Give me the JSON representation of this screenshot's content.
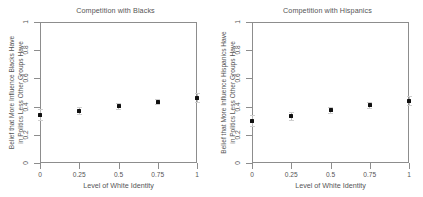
{
  "figure": {
    "xlabel": "Level of White Identity",
    "x_ticks": [
      "0",
      "0.25",
      "0.5",
      "0.75",
      "1"
    ],
    "y_ticks": [
      "0",
      "0.2",
      "0.4",
      "0.6",
      "0.8",
      "1"
    ]
  },
  "panels": [
    {
      "title": "Competition with Blacks",
      "ylabel_line1": "Belief that More Influence Blacks Have",
      "ylabel_line2": "in Politics Less Other Groups Have"
    },
    {
      "title": "Competition with Hispanics",
      "ylabel_line1": "Belief that More Influence Hispanics Have",
      "ylabel_line2": "in Politics Less Other Groups Have"
    }
  ],
  "chart_data": [
    {
      "type": "scatter",
      "title": "Competition with Blacks",
      "xlabel": "Level of White Identity",
      "ylabel": "Belief that More Influence Blacks Have in Politics Less Other Groups Have",
      "x": [
        0,
        0.25,
        0.5,
        0.75,
        1
      ],
      "values": [
        0.34,
        0.37,
        0.405,
        0.435,
        0.46
      ],
      "err_low": [
        0.305,
        0.345,
        0.385,
        0.415,
        0.43
      ],
      "err_high": [
        0.385,
        0.4,
        0.425,
        0.455,
        0.495
      ],
      "xlim": [
        0,
        1
      ],
      "ylim": [
        0,
        1
      ],
      "xtick_values": [
        0,
        0.25,
        0.5,
        0.75,
        1
      ],
      "ytick_values": [
        0,
        0.2,
        0.4,
        0.6,
        0.8,
        1
      ],
      "grid": false,
      "legend": "none",
      "marker": "filled-square",
      "error_bars": "95% confidence interval"
    },
    {
      "type": "scatter",
      "title": "Competition with Hispanics",
      "xlabel": "Level of White Identity",
      "ylabel": "Belief that More Influence Hispanics Have in Politics Less Other Groups Have",
      "x": [
        0,
        0.25,
        0.5,
        0.75,
        1
      ],
      "values": [
        0.3,
        0.335,
        0.375,
        0.41,
        0.44
      ],
      "err_low": [
        0.265,
        0.305,
        0.355,
        0.39,
        0.41
      ],
      "err_high": [
        0.34,
        0.365,
        0.4,
        0.435,
        0.475
      ],
      "xlim": [
        0,
        1
      ],
      "ylim": [
        0,
        1
      ],
      "xtick_values": [
        0,
        0.25,
        0.5,
        0.75,
        1
      ],
      "ytick_values": [
        0,
        0.2,
        0.4,
        0.6,
        0.8,
        1
      ],
      "grid": false,
      "legend": "none",
      "marker": "filled-square",
      "error_bars": "95% confidence interval"
    }
  ]
}
